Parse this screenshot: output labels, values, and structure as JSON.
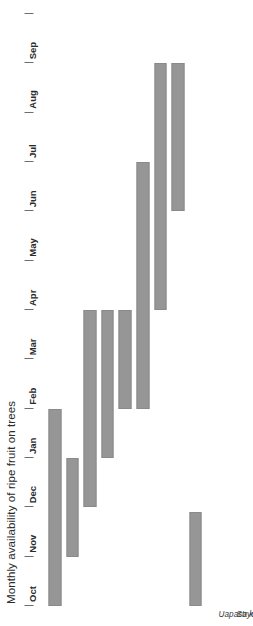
{
  "chart_data": {
    "type": "bar",
    "orientation": "horizontal-gantt",
    "title": "Monthly availability of ripe fruit on trees",
    "xlabel": "",
    "ylabel": "",
    "grid": false,
    "legend": false,
    "bar_color": "#969696",
    "axis_ticks": [
      "Oct",
      "Nov",
      "Dec",
      "Jan",
      "Feb",
      "Mar",
      "Apr",
      "May",
      "Jun",
      "Jul",
      "Aug",
      "Sep"
    ],
    "xlim": [
      "Oct",
      "Sep+1"
    ],
    "categories": [
      "Uapaca kirkiana",
      "Strychnos cocculoides",
      "Azanza garckeana",
      "Flacourtia indica",
      "Vangueria infausta",
      "Vitex doniana",
      "Adansonia digitata",
      "Ziziphus mauritiana",
      "Parinari curatellifolia"
    ],
    "ranges": [
      {
        "name": "Uapaca kirkiana",
        "start": "Oct",
        "end": "Feb",
        "start_index": 0,
        "end_index": 4
      },
      {
        "name": "Strychnos cocculoides",
        "start": "Nov",
        "end": "Jan",
        "start_index": 1,
        "end_index": 3
      },
      {
        "name": "Azanza garckeana",
        "start": "Dec",
        "end": "Apr",
        "start_index": 2,
        "end_index": 6
      },
      {
        "name": "Flacourtia indica",
        "start": "Jan",
        "end": "Apr",
        "start_index": 3,
        "end_index": 6
      },
      {
        "name": "Vangueria infausta",
        "start": "Feb",
        "end": "Apr",
        "start_index": 4,
        "end_index": 6
      },
      {
        "name": "Vitex doniana",
        "start": "Feb",
        "end": "Jul",
        "start_index": 4,
        "end_index": 9
      },
      {
        "name": "Adansonia digitata",
        "start": "Apr",
        "end": "Sep",
        "start_index": 6,
        "end_index": 11
      },
      {
        "name": "Ziziphus mauritiana",
        "start": "Jun",
        "end": "Sep",
        "start_index": 8,
        "end_index": 11
      },
      {
        "name": "Parinari curatellifolia",
        "start": "Oct",
        "end": "Nov",
        "start_index": 0,
        "end_index": 1.9
      }
    ]
  }
}
